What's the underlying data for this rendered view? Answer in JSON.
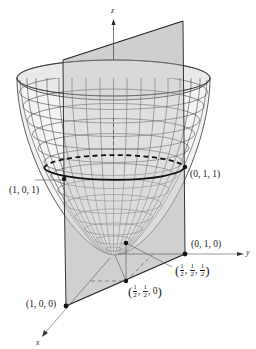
{
  "figure": {
    "axes": {
      "x_label": "x",
      "y_label": "y",
      "z_label": "z"
    },
    "colors": {
      "plane_fill": "#d4d4d4",
      "surface_fill": "#f2f2f2",
      "grid_line": "#3a3a3a",
      "curve": "#111111",
      "axis": "#444444"
    },
    "points": [
      {
        "id": "p101",
        "label": "(1, 0, 1)"
      },
      {
        "id": "p011",
        "label": "(0, 1, 1)"
      },
      {
        "id": "p010",
        "label": "(0, 1, 0)"
      },
      {
        "id": "p100",
        "label": "(1, 0, 0)"
      },
      {
        "id": "phalf0",
        "label_parts": [
          "1",
          "2",
          "1",
          "2",
          "0"
        ],
        "label": "(1/2, 1/2, 0)"
      },
      {
        "id": "phalfhalf",
        "label_parts": [
          "1",
          "2",
          "1",
          "2",
          "1",
          "2"
        ],
        "label": "(1/2, 1/2, 1/2)"
      }
    ]
  }
}
